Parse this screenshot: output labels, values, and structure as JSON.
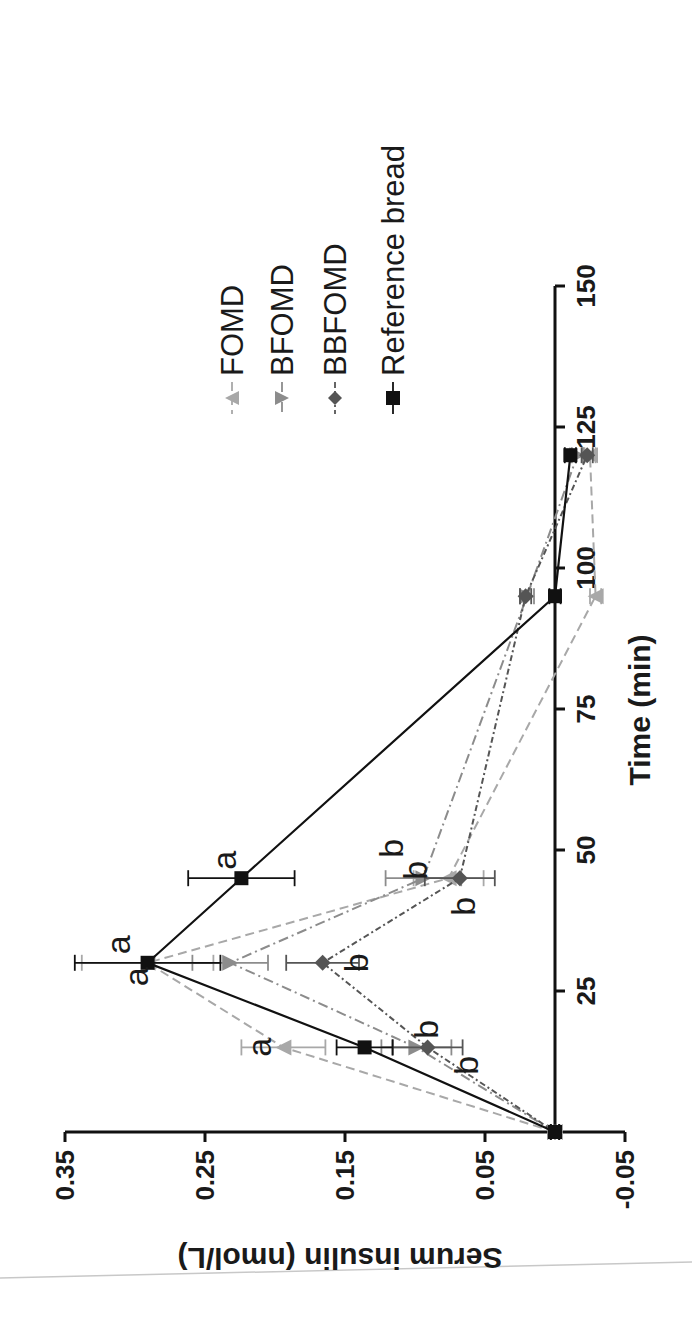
{
  "chart_data": {
    "type": "line",
    "orientation_note": "figure rotated 90 degrees clockwise",
    "title": "",
    "xlabel": "Time (min)",
    "ylabel": "Serum insulin (nmol/L)",
    "xlim": [
      0,
      150
    ],
    "ylim": [
      -0.05,
      0.35
    ],
    "x_ticks": [
      25,
      50,
      75,
      100,
      125,
      150
    ],
    "y_ticks": [
      -0.05,
      0.05,
      0.15,
      0.25,
      0.35
    ],
    "x_tick_labels": [
      "25",
      "50",
      "75",
      "100",
      "125",
      "150"
    ],
    "y_tick_labels": [
      "-0.05",
      "0.05",
      "0.15",
      "0.25",
      "0.35"
    ],
    "grid": false,
    "legend_position": "upper right (rotated)",
    "x": [
      0,
      15,
      30,
      45,
      95,
      120
    ],
    "series": [
      {
        "name": "FOMD",
        "marker": "triangle-up",
        "line": "dashed",
        "color": "#a8a8a8",
        "values": [
          0.0,
          0.194,
          0.291,
          0.076,
          -0.029,
          -0.025
        ],
        "errors": [
          0.003,
          0.03,
          0.047,
          0.025,
          0.004,
          0.004
        ],
        "letters": [
          "",
          "a",
          "a",
          "b",
          "",
          ""
        ]
      },
      {
        "name": "BFOMD",
        "marker": "triangle-down",
        "line": "dash-dot",
        "color": "#8c8c8c",
        "values": [
          0.0,
          0.099,
          0.232,
          0.094,
          0.02,
          -0.016
        ],
        "errors": [
          0.003,
          0.025,
          0.027,
          0.027,
          0.005,
          0.004
        ],
        "letters": [
          "",
          "b",
          "",
          "b",
          "",
          ""
        ]
      },
      {
        "name": "BBFOMD",
        "marker": "diamond",
        "line": "dotted-dash",
        "color": "#555555",
        "values": [
          0.0,
          0.091,
          0.166,
          0.068,
          0.021,
          -0.023
        ],
        "errors": [
          0.003,
          0.025,
          0.026,
          0.025,
          0.004,
          0.004
        ],
        "letters": [
          "",
          "b",
          "b",
          "b",
          "",
          ""
        ]
      },
      {
        "name": "Reference bread",
        "marker": "square",
        "line": "solid",
        "color": "#111111",
        "values": [
          0.0,
          0.136,
          0.291,
          0.224,
          0.0,
          -0.011
        ],
        "errors": [
          0.003,
          0.02,
          0.052,
          0.038,
          0.004,
          0.004
        ],
        "letters": [
          "",
          "",
          "a",
          "a",
          "",
          ""
        ]
      }
    ]
  },
  "axes": {
    "x_title": "Time (min)",
    "y_title": "Serum insulin (nmol/L)"
  },
  "legend": {
    "items": [
      {
        "label": "FOMD"
      },
      {
        "label": "BFOMD"
      },
      {
        "label": "BBFOMD"
      },
      {
        "label": "Reference bread"
      }
    ]
  }
}
